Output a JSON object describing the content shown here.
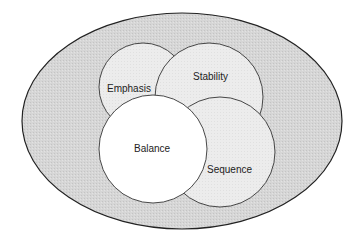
{
  "diagram": {
    "type": "venn",
    "outer": {
      "label": "",
      "fill": "#d4d4d4"
    },
    "circles": [
      {
        "id": "emphasis",
        "label": "Emphasis",
        "fill": "#eeeeee"
      },
      {
        "id": "stability",
        "label": "Stability",
        "fill": "#ebebeb"
      },
      {
        "id": "sequence",
        "label": "Sequence",
        "fill": "#ebebeb"
      },
      {
        "id": "balance",
        "label": "Balance",
        "fill": "#ffffff"
      }
    ],
    "stroke_color": "#333333"
  }
}
